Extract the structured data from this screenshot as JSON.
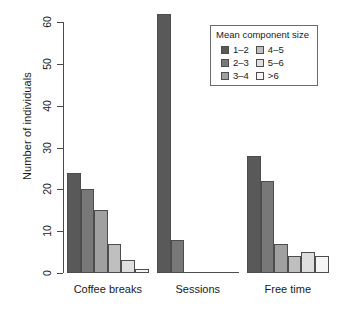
{
  "chart_data": {
    "type": "bar",
    "title": "",
    "subtitle": "",
    "xlabel": "",
    "ylabel": "Number of individuals",
    "categories": [
      "Coffee breaks",
      "Sessions",
      "Free time"
    ],
    "series": [
      {
        "name": "1–2",
        "color": "#595959",
        "values": [
          24,
          62,
          28
        ]
      },
      {
        "name": "2–3",
        "color": "#787878",
        "values": [
          20,
          8,
          22
        ]
      },
      {
        "name": "3–4",
        "color": "#a0a0a0",
        "values": [
          15,
          0,
          7
        ]
      },
      {
        "name": "4–5",
        "color": "#bfbfbf",
        "values": [
          7,
          0,
          4
        ]
      },
      {
        "name": "5–6",
        "color": "#dedede",
        "values": [
          3,
          0,
          5
        ]
      },
      {
        "name": ">6",
        "color": "#f5f5f5",
        "values": [
          1,
          0,
          4
        ]
      }
    ],
    "ylim": [
      0,
      60
    ],
    "yticks": [
      0,
      10,
      20,
      30,
      40,
      50,
      60
    ],
    "ytick_labels": [
      "0",
      "10",
      "20",
      "30",
      "40",
      "50",
      "60"
    ],
    "grid": false,
    "legend": {
      "title": "Mean component size",
      "position": "top-right",
      "columns": 2,
      "entries": [
        {
          "label": "1–2",
          "color": "#595959"
        },
        {
          "label": "2–3",
          "color": "#787878"
        },
        {
          "label": "3–4",
          "color": "#a0a0a0"
        },
        {
          "label": "4–5",
          "color": "#bfbfbf"
        },
        {
          "label": "5–6",
          "color": "#dedede"
        },
        {
          "label": ">6",
          "color": "#f5f5f5"
        }
      ]
    },
    "axis_color": "#4a4a4a",
    "bar_border_color": "#4d4d4d",
    "background": "#ffffff"
  }
}
